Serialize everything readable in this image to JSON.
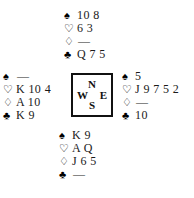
{
  "diagram": {
    "type": "bridge-hand-deal",
    "background_color": "#ffffff",
    "ink_color": "#111111"
  },
  "suits": {
    "spade": {
      "name": "spade-symbol",
      "glyph": "♠",
      "fill": "solid"
    },
    "heart": {
      "name": "heart-symbol",
      "glyph": "♡",
      "fill": "hollow"
    },
    "diamond": {
      "name": "diamond-symbol",
      "glyph": "♢",
      "fill": "hollow"
    },
    "club": {
      "name": "club-symbol",
      "glyph": "♣",
      "fill": "solid"
    },
    "void": "—"
  },
  "compass": {
    "north": "N",
    "west": "W",
    "east": "E",
    "south": "S"
  },
  "hands": {
    "north": {
      "position": "North",
      "spades": "10 8",
      "hearts": "6 3",
      "diamonds": "—",
      "clubs": "Q 7 5"
    },
    "west": {
      "position": "West",
      "spades": "—",
      "hearts": "K 10 4",
      "diamonds": "A 10",
      "clubs": "K 9"
    },
    "east": {
      "position": "East",
      "spades": "5",
      "hearts": "J 9 7 5 2",
      "diamonds": "—",
      "clubs": "10"
    },
    "south": {
      "position": "South",
      "spades": "K 9",
      "hearts": "A Q",
      "diamonds": "J 6 5",
      "clubs": "—"
    }
  }
}
